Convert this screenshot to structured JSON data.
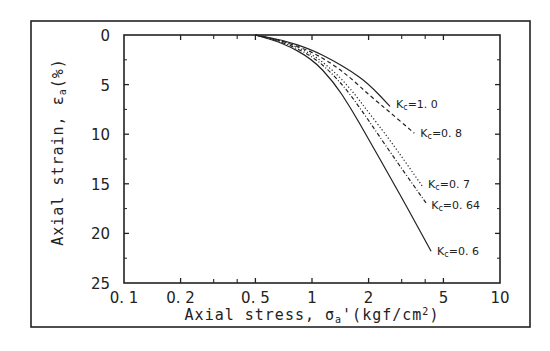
{
  "chart_data": {
    "type": "line",
    "title": "",
    "xlabel": "Axial stress, σa' (kgf/cm2)",
    "ylabel": "Axial strain, εa(%)",
    "xscale": "log",
    "xlim": [
      0.1,
      10
    ],
    "ylim": [
      0,
      25
    ],
    "y_inverted": true,
    "grid": false,
    "legend_position": "inline curve labels at line ends",
    "x_ticks": [
      0.1,
      0.2,
      0.5,
      1,
      2,
      5,
      10
    ],
    "x_tick_labels": [
      "0. 1",
      "0. 2",
      "0. 5",
      "1",
      "2",
      "5",
      "10"
    ],
    "x_minor_ticks": [
      0.3,
      0.4,
      3,
      4
    ],
    "y_ticks": [
      0,
      5,
      10,
      15,
      20,
      25
    ],
    "y_tick_labels": [
      "0",
      "5",
      "10",
      "15",
      "20",
      "25"
    ],
    "series": [
      {
        "name": "Kc=1.0",
        "label": "Kc=1. 0",
        "style": "solid",
        "points": [
          [
            0.5,
            0.0
          ],
          [
            0.7,
            0.5
          ],
          [
            1.0,
            1.5
          ],
          [
            1.3,
            2.6
          ],
          [
            1.6,
            3.6
          ],
          [
            2.0,
            4.9
          ],
          [
            2.6,
            7.2
          ]
        ]
      },
      {
        "name": "Kc=0.8",
        "label": "Kc=0. 8",
        "style": "dashed",
        "points": [
          [
            0.5,
            0.0
          ],
          [
            0.7,
            0.6
          ],
          [
            1.0,
            1.7
          ],
          [
            1.3,
            3.0
          ],
          [
            1.6,
            4.3
          ],
          [
            2.0,
            6.0
          ],
          [
            2.6,
            7.8
          ],
          [
            3.5,
            9.9
          ]
        ]
      },
      {
        "name": "Kc=0.7",
        "label": "Kc=0. 7",
        "style": "dotted",
        "points": [
          [
            0.5,
            0.0
          ],
          [
            0.7,
            0.6
          ],
          [
            1.0,
            1.9
          ],
          [
            1.3,
            3.6
          ],
          [
            1.6,
            5.4
          ],
          [
            2.0,
            7.8
          ],
          [
            2.6,
            10.6
          ],
          [
            3.85,
            15.2
          ]
        ]
      },
      {
        "name": "Kc=0.64",
        "label": "Kc=0. 64",
        "style": "dash-dot",
        "points": [
          [
            0.5,
            0.0
          ],
          [
            0.7,
            0.7
          ],
          [
            1.0,
            2.1
          ],
          [
            1.3,
            4.0
          ],
          [
            1.6,
            6.0
          ],
          [
            2.0,
            8.6
          ],
          [
            2.6,
            11.8
          ],
          [
            4.1,
            17.1
          ]
        ]
      },
      {
        "name": "Kc=0.6",
        "label": "Kc=0. 6",
        "style": "solid",
        "points": [
          [
            0.5,
            0.0
          ],
          [
            0.7,
            0.8
          ],
          [
            1.0,
            2.4
          ],
          [
            1.3,
            4.7
          ],
          [
            1.6,
            7.3
          ],
          [
            2.0,
            10.5
          ],
          [
            2.6,
            14.3
          ],
          [
            3.3,
            17.8
          ],
          [
            4.3,
            21.8
          ]
        ]
      }
    ]
  }
}
